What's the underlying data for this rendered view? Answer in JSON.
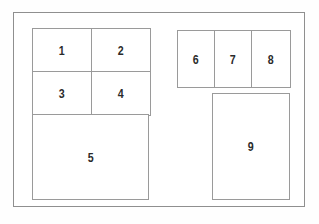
{
  "diagram": {
    "type": "region-layout-diagram",
    "frame": {
      "name": "outer-page-frame",
      "stroke_color": "#8f8f8f",
      "fill_color": "#ffffff"
    },
    "cell_stroke_color": "#9a9a9a",
    "label_color": "#2b2b2b",
    "background_color": "#fefefe",
    "groups": [
      {
        "name": "left-group",
        "blocks": [
          {
            "name": "grid-1234",
            "arrangement": "2x2",
            "cells": [
              {
                "label": "1",
                "row": 1,
                "col": 1
              },
              {
                "label": "2",
                "row": 1,
                "col": 2
              },
              {
                "label": "3",
                "row": 2,
                "col": 1
              },
              {
                "label": "4",
                "row": 2,
                "col": 2
              }
            ]
          },
          {
            "name": "wide-block",
            "arrangement": "single",
            "cells": [
              {
                "label": "5",
                "row": 1,
                "col": 1
              }
            ]
          }
        ]
      },
      {
        "name": "right-group",
        "blocks": [
          {
            "name": "strip-678",
            "arrangement": "1x3",
            "cells": [
              {
                "label": "6",
                "row": 1,
                "col": 1
              },
              {
                "label": "7",
                "row": 1,
                "col": 2
              },
              {
                "label": "8",
                "row": 1,
                "col": 3
              }
            ]
          },
          {
            "name": "tall-block",
            "arrangement": "single",
            "cells": [
              {
                "label": "9",
                "row": 1,
                "col": 1
              }
            ]
          }
        ]
      }
    ]
  }
}
